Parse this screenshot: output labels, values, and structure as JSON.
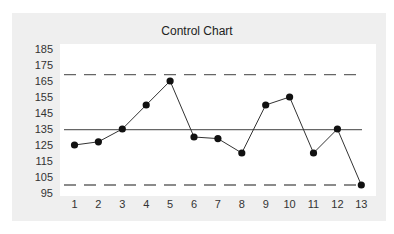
{
  "chart_data": {
    "type": "line",
    "title": "Control Chart",
    "xlabel": "",
    "ylabel": "",
    "x": [
      1,
      2,
      3,
      4,
      5,
      6,
      7,
      8,
      9,
      10,
      11,
      12,
      13
    ],
    "series": [
      {
        "name": "Observations",
        "values": [
          125,
          127,
          135,
          150,
          165,
          130,
          129,
          120,
          150,
          155,
          120,
          135,
          100
        ],
        "color": "#111111",
        "marker": "circle"
      }
    ],
    "reference_lines": [
      {
        "name": "UCL",
        "value": 169,
        "style": "dashed",
        "color": "#666666"
      },
      {
        "name": "Center Line",
        "value": 134.6,
        "style": "solid",
        "color": "#666666"
      },
      {
        "name": "LCL",
        "value": 100,
        "style": "dashed",
        "color": "#666666"
      }
    ],
    "yticks": [
      95,
      105,
      115,
      125,
      135,
      145,
      155,
      165,
      175,
      185
    ],
    "xticks": [
      "1",
      "2",
      "3",
      "4",
      "5",
      "6",
      "7",
      "8",
      "9",
      "10",
      "11",
      "12",
      "13"
    ],
    "ylim": [
      95,
      185
    ],
    "xlim": [
      1,
      13
    ],
    "grid": false,
    "legend": null
  },
  "colors": {
    "panel_background": "#efefef",
    "plot_background": "#ffffff",
    "line": "#333333",
    "marker": "#111111",
    "reference": "#666666"
  }
}
